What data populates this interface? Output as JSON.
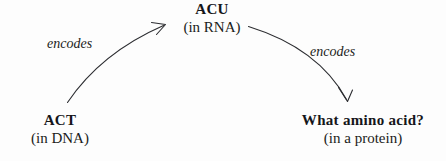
{
  "diagram": {
    "background_color": "#fdfdfd",
    "stroke_color": "#2c2d31",
    "text_color": "#1a1a1a",
    "nodes": [
      {
        "id": "act",
        "title": "ACT",
        "subtitle": "(in DNA)"
      },
      {
        "id": "acu",
        "title": "ACU",
        "subtitle": "(in RNA)"
      },
      {
        "id": "protein",
        "title": "What amino acid?",
        "subtitle": "(in a protein)"
      }
    ],
    "edges": [
      {
        "id": "act-to-acu",
        "label": "encodes",
        "from": "act",
        "to": "acu"
      },
      {
        "id": "acu-to-protein",
        "label": "encodes",
        "from": "acu",
        "to": "protein"
      }
    ]
  }
}
